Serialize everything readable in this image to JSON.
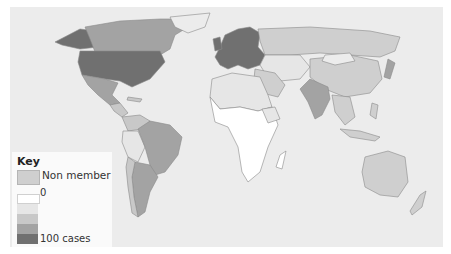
{
  "map": {
    "type": "choropleth-world",
    "background_color": "#ececec",
    "colors": {
      "non_member": "#cfcfcf",
      "scale": [
        "#ffffff",
        "#e6e6e6",
        "#c8c8c8",
        "#a3a3a3",
        "#707070"
      ],
      "border": "#8a8a8a"
    }
  },
  "key": {
    "title": "Key",
    "non_member_label": "Non member",
    "scale_min_label": "0",
    "scale_max_label": "100 cases"
  }
}
